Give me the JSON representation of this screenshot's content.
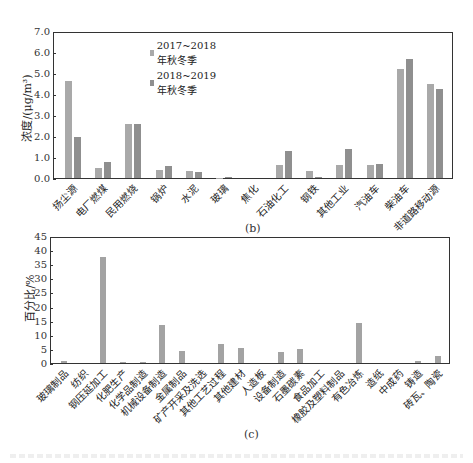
{
  "colors": {
    "series_2017": "#a9a9a9",
    "series_2018": "#8f8f8f",
    "bar_c": "#a3a3a3",
    "axis": "#333333"
  },
  "chart_data": [
    {
      "panel": "(b)",
      "type": "bar",
      "title": "",
      "xlabel": "",
      "ylabel": "浓度/(μg/m³)",
      "ylim": [
        0,
        7.0
      ],
      "yticks": [
        "0.0",
        "1.0",
        "2.0",
        "3.0",
        "4.0",
        "5.0",
        "6.0",
        "7.0"
      ],
      "grid": false,
      "legend_position": "upper-left-inside",
      "categories": [
        "扬尘源",
        "电厂燃煤",
        "民用燃烧",
        "锅炉",
        "水泥",
        "玻璃",
        "焦化",
        "石油化工",
        "钢铁",
        "其他工业",
        "汽油车",
        "柴油车",
        "非道路移动源"
      ],
      "series": [
        {
          "name": "2017~2018年秋冬季",
          "values": [
            4.7,
            0.5,
            2.62,
            0.4,
            0.35,
            0.02,
            0.0,
            0.65,
            0.35,
            0.65,
            0.63,
            5.25,
            4.55
          ]
        },
        {
          "name": "2018~2019年秋冬季",
          "values": [
            2.0,
            0.75,
            2.6,
            0.57,
            0.3,
            0.03,
            0.0,
            1.3,
            0.03,
            1.4,
            0.7,
            5.75,
            4.3
          ]
        }
      ]
    },
    {
      "panel": "(c)",
      "type": "bar",
      "title": "",
      "xlabel": "",
      "ylabel": "百分比/%",
      "ylim": [
        0,
        45
      ],
      "yticks": [
        "0",
        "5",
        "10",
        "15",
        "20",
        "25",
        "30",
        "35",
        "40",
        "45"
      ],
      "grid": false,
      "categories": [
        "玻璃制品",
        "纺织",
        "钢压延加工",
        "化肥生产",
        "化学品制造",
        "机械设备制造",
        "金属制品",
        "矿产开采及洗选",
        "其他工艺过程",
        "其他建材",
        "人造板",
        "设备制造",
        "石墨碳素",
        "食品加工",
        "橡胶及塑料制品",
        "有色冶炼",
        "造纸",
        "中成药",
        "铸造",
        "砖瓦、陶瓷"
      ],
      "values": [
        0.8,
        0.0,
        38.3,
        0.3,
        0.2,
        13.8,
        4.4,
        0.0,
        7.0,
        5.4,
        0.0,
        4.1,
        5.2,
        0.0,
        0.0,
        14.5,
        0.0,
        0.0,
        0.6,
        2.6
      ]
    }
  ]
}
